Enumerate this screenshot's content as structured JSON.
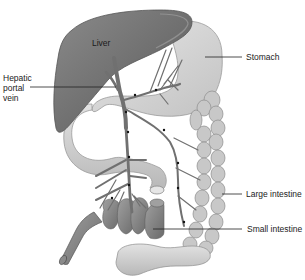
{
  "figure": {
    "type": "anatomical illustration",
    "colors": {
      "organ_dark": "#6e6e6e",
      "organ_mid": "#a9a9a9",
      "organ_light": "#d4d4d4",
      "vessel": "#7a7a7a",
      "leader_line": "#222222",
      "text": "#222222"
    },
    "labels": {
      "liver": "Liver",
      "stomach": "Stomach",
      "hepatic_portal_vein": [
        "Hepatic",
        "portal",
        "vein"
      ],
      "large_intestine": "Large intestine",
      "small_intestine": "Small intestine"
    }
  }
}
